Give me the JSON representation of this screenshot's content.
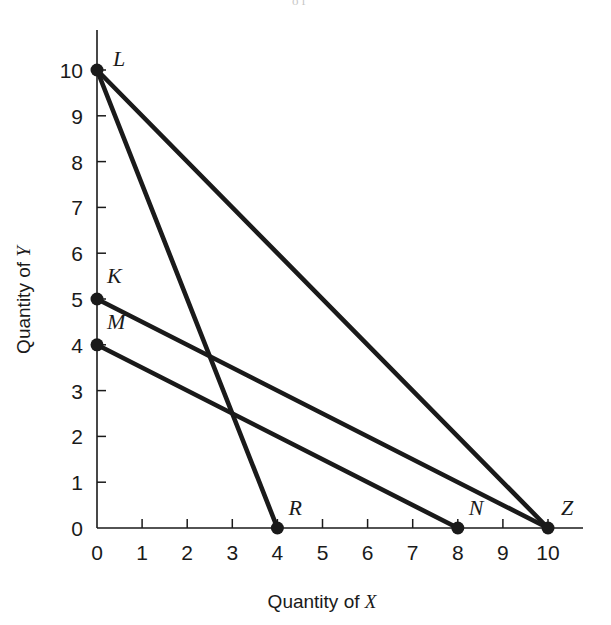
{
  "figure": {
    "scan_artifact_text": "of",
    "x_axis_title_prefix": "Quantity of ",
    "x_axis_title_var": "X",
    "y_axis_title_prefix": "Quantity of ",
    "y_axis_title_var": "Y"
  },
  "chart_data": {
    "type": "line",
    "title": "",
    "xlabel": "Quantity of X",
    "ylabel": "Quantity of Y",
    "xlim": [
      0,
      10
    ],
    "ylim": [
      0,
      10
    ],
    "xticks": [
      "0",
      "1",
      "2",
      "3",
      "4",
      "5",
      "6",
      "7",
      "8",
      "9",
      "10"
    ],
    "yticks": [
      "0",
      "1",
      "2",
      "3",
      "4",
      "5",
      "6",
      "7",
      "8",
      "9",
      "10"
    ],
    "grid": false,
    "legend": "none",
    "line_color": "#1a1a1a",
    "points": [
      {
        "label": "L",
        "x": 0,
        "y": 10,
        "label_dx": 16,
        "label_dy": -4
      },
      {
        "label": "K",
        "x": 0,
        "y": 5,
        "label_dx": 10,
        "label_dy": -16
      },
      {
        "label": "M",
        "x": 0,
        "y": 4,
        "label_dx": 10,
        "label_dy": -16
      },
      {
        "label": "R",
        "x": 4,
        "y": 0,
        "label_dx": 11,
        "label_dy": -13
      },
      {
        "label": "N",
        "x": 8,
        "y": 0,
        "label_dx": 11,
        "label_dy": -13
      },
      {
        "label": "Z",
        "x": 10,
        "y": 0,
        "label_dx": 13,
        "label_dy": -13
      }
    ],
    "series": [
      {
        "name": "L-Z",
        "from": "L",
        "to": "Z",
        "x": [
          0,
          10
        ],
        "values": [
          10,
          0
        ]
      },
      {
        "name": "L-R",
        "from": "L",
        "to": "R",
        "x": [
          0,
          4
        ],
        "values": [
          10,
          0
        ]
      },
      {
        "name": "K-Z",
        "from": "K",
        "to": "Z",
        "x": [
          0,
          10
        ],
        "values": [
          5,
          0
        ]
      },
      {
        "name": "M-N",
        "from": "M",
        "to": "N",
        "x": [
          0,
          8
        ],
        "values": [
          4,
          0
        ]
      }
    ]
  }
}
